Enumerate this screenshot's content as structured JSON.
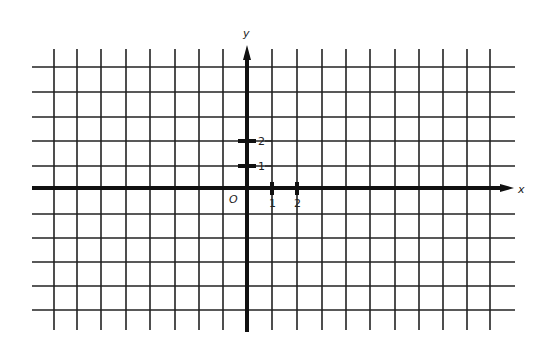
{
  "diagram": {
    "type": "coordinate-plane",
    "axes": {
      "x_label": "x",
      "y_label": "y",
      "origin_label": "O"
    },
    "x_ticks": [
      {
        "label": "1",
        "px": 272
      },
      {
        "label": "2",
        "px": 297
      }
    ],
    "y_ticks": [
      {
        "label": "1",
        "py": 166
      },
      {
        "label": "2",
        "py": 141
      }
    ],
    "grid": {
      "vertical_lines_px": [
        54,
        77,
        101,
        126,
        150,
        175,
        199,
        223,
        272,
        297,
        322,
        346,
        370,
        395,
        419,
        443,
        467,
        490
      ],
      "horizontal_lines_px": [
        67,
        92,
        117,
        141,
        166,
        214,
        238,
        262,
        286,
        310
      ],
      "x_extent": [
        32,
        515
      ],
      "y_extent": [
        45,
        330
      ]
    },
    "colors": {
      "line": "#222222",
      "background": "#ffffff"
    }
  }
}
